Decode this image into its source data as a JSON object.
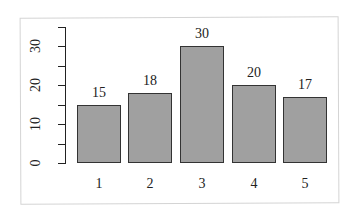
{
  "chart_data": {
    "type": "bar",
    "title": "",
    "xlabel": "",
    "ylabel": "",
    "categories": [
      "1",
      "2",
      "3",
      "4",
      "5"
    ],
    "values": [
      15,
      18,
      30,
      20,
      17
    ],
    "value_labels": [
      "15",
      "18",
      "30",
      "20",
      "17"
    ],
    "yticks": [
      0,
      10,
      20,
      30
    ],
    "ytick_labels": [
      "0",
      "10",
      "20",
      "30"
    ],
    "minor_ticks": [
      5,
      15,
      25,
      35
    ],
    "ylim": [
      0,
      35
    ],
    "grid": false,
    "legend": null,
    "bar_color": "#a0a0a0",
    "bar_edge_color": "#333333"
  }
}
